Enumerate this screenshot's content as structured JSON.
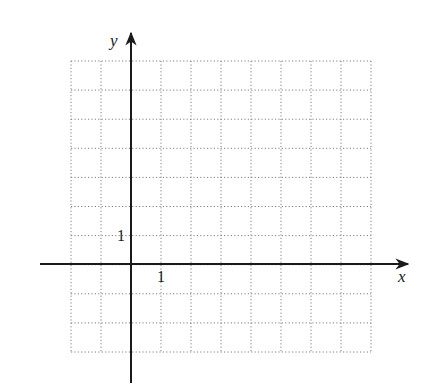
{
  "diagram": {
    "type": "coordinate-grid",
    "grid": {
      "columns": 10,
      "rows": 10,
      "x_range": [
        -2,
        8
      ],
      "y_range": [
        -3,
        7
      ],
      "line_style": "dotted",
      "line_color": "#808080"
    },
    "axes": {
      "x_label": "x",
      "y_label": "y",
      "axis_color": "#1a1a1a"
    },
    "tick_labels": {
      "x_unit": "1",
      "y_unit": "1"
    }
  }
}
